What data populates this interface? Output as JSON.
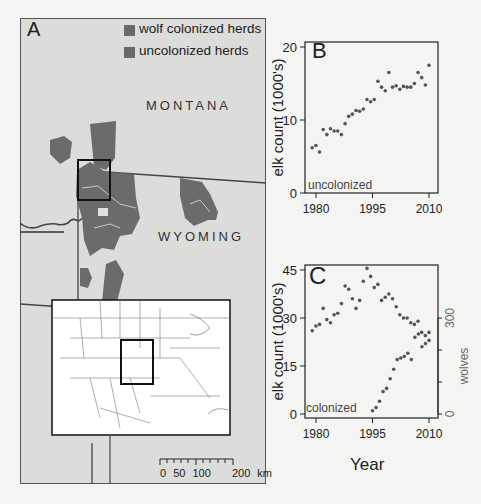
{
  "figure": {
    "panel_a": {
      "letter": "A",
      "legend": [
        {
          "label": "wolf colonized herds",
          "color": "#666666"
        },
        {
          "label": "uncolonized herds",
          "color": "#6e6e6e"
        }
      ],
      "state_labels": [
        "MONTANA",
        "WYOMING"
      ],
      "scale_bar": {
        "ticks": [
          "0",
          "50",
          "100",
          "200 km"
        ]
      }
    },
    "panel_b": {
      "letter": "B",
      "annotation": "uncolonized"
    },
    "panel_c": {
      "letter": "C",
      "annotation": "colonized"
    },
    "shared_xlabel": "Year"
  },
  "chart_data": [
    {
      "type": "scatter",
      "panel": "B",
      "title": "",
      "annotation": "uncolonized",
      "xlabel": "",
      "ylabel": "elk count (1000's)",
      "xlim": [
        1977,
        2011
      ],
      "ylim": [
        0,
        20
      ],
      "xticks": [
        1980,
        1995,
        2010
      ],
      "yticks": [
        0,
        10,
        20
      ],
      "grid": false,
      "series": [
        {
          "name": "uncolonized elk",
          "x": [
            1979,
            1980,
            1981,
            1982,
            1983,
            1984,
            1985,
            1986,
            1987,
            1988,
            1989,
            1990,
            1991,
            1992,
            1993,
            1994,
            1995,
            1996,
            1997,
            1998,
            1999,
            2000,
            2001,
            2002,
            2003,
            2004,
            2005,
            2006,
            2007,
            2008,
            2009,
            2010
          ],
          "y": [
            6.2,
            6.5,
            5.6,
            8.7,
            8.0,
            8.8,
            8.5,
            8.5,
            8.0,
            9.5,
            10.5,
            10.8,
            11.3,
            11.2,
            11.5,
            12.8,
            12.5,
            12.8,
            15.3,
            14.5,
            14.0,
            16.5,
            14.5,
            14.7,
            14.2,
            14.6,
            14.5,
            14.5,
            15.0,
            16.5,
            15.8,
            14.8,
            17.5
          ]
        }
      ]
    },
    {
      "type": "scatter",
      "panel": "C",
      "title": "",
      "annotation": "colonized",
      "xlabel": "Year",
      "ylabel": "elk count (1000's)",
      "y2label": "wolves",
      "xlim": [
        1977,
        2011
      ],
      "ylim": [
        0,
        45
      ],
      "y2lim": [
        0,
        450
      ],
      "xticks": [
        1980,
        1995,
        2010
      ],
      "yticks": [
        0,
        15,
        30,
        45
      ],
      "y2ticks": [
        0,
        300
      ],
      "grid": false,
      "series": [
        {
          "name": "colonized elk",
          "axis": "left",
          "x": [
            1979,
            1980,
            1981,
            1982,
            1983,
            1984,
            1985,
            1986,
            1987,
            1988,
            1989,
            1990,
            1991,
            1992,
            1993,
            1994,
            1995,
            1996,
            1997,
            1998,
            1999,
            2000,
            2001,
            2002,
            2003,
            2004,
            2005,
            2006,
            2007,
            2008,
            2009,
            2010
          ],
          "y": [
            26,
            27.5,
            28,
            33,
            29.5,
            28.5,
            31,
            31.5,
            34.5,
            40,
            39,
            36,
            33,
            35.5,
            41.5,
            45.5,
            43,
            39.5,
            40.5,
            35.5,
            36.5,
            37.5,
            36,
            33.5,
            31,
            30,
            30,
            28.5,
            28,
            29,
            25.5,
            24.5,
            25.5
          ]
        },
        {
          "name": "wolves",
          "axis": "right",
          "x": [
            1995,
            1996,
            1997,
            1998,
            1999,
            2000,
            2001,
            2002,
            2003,
            2004,
            2005,
            2006,
            2007,
            2008,
            2009,
            2010
          ],
          "y": [
            10,
            20,
            40,
            70,
            80,
            110,
            140,
            170,
            175,
            180,
            190,
            170,
            240,
            250,
            210,
            220,
            230
          ]
        }
      ]
    }
  ]
}
